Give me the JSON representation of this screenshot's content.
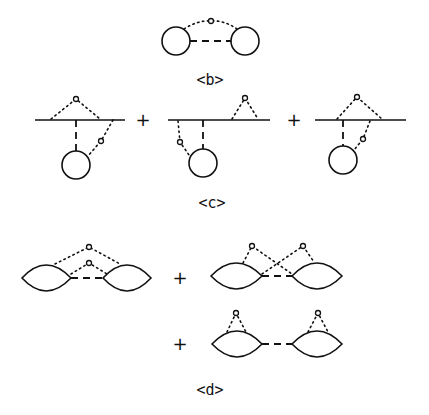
{
  "labels": {
    "b": "<b>",
    "c": "<c>",
    "d": "<d>"
  },
  "operators": {
    "plus": "+"
  },
  "diagrams": {
    "b": {
      "description": "two circles joined by dashed line with dotted arc through vertex"
    },
    "c": [
      {
        "description": "line with top dotted loop and dotted line to circle"
      },
      {
        "description": "line with right dotted loop and left dotted line to circle"
      },
      {
        "description": "line with top dotted loop and right dotted line to circle"
      }
    ],
    "d": [
      {
        "description": "two lenses joined by dashed line with two dotted arcs"
      },
      {
        "description": "two lenses with crossing dotted lines"
      },
      {
        "description": "two lenses each with own dotted loop"
      }
    ]
  }
}
